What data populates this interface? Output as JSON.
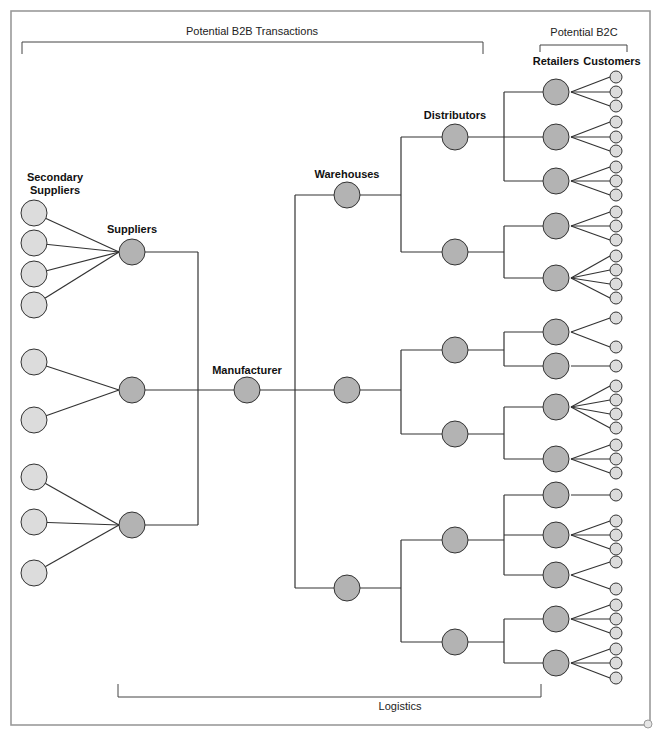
{
  "title_brackets": {
    "b2b": "Potential B2B Transactions",
    "b2c": "Potential B2C",
    "logistics": "Logistics"
  },
  "column_labels": {
    "secondary_suppliers_line1": "Secondary",
    "secondary_suppliers_line2": "Suppliers",
    "suppliers": "Suppliers",
    "manufacturer": "Manufacturer",
    "warehouses": "Warehouses",
    "distributors": "Distributors",
    "retailers": "Retailers",
    "customers": "Customers"
  },
  "colors": {
    "dark_node": "#b3b3b3",
    "light_node": "#dcdcdc",
    "stroke": "#333333",
    "frame": "#9a9a9a"
  },
  "structure": {
    "secondary_suppliers_per_supplier": [
      4,
      2,
      3
    ],
    "suppliers": 3,
    "manufacturer": 1,
    "warehouses": 3,
    "distributors_per_warehouse": [
      2,
      2,
      2
    ],
    "retailers_per_distributor": [
      3,
      2,
      2,
      2,
      3,
      2
    ],
    "customers_per_retailer": [
      3,
      3,
      3,
      3,
      4,
      2,
      1,
      4,
      3,
      1,
      3,
      2,
      3,
      3
    ]
  },
  "nodes": {
    "secondary_suppliers": [
      {
        "x": 34,
        "y": 213,
        "to": 0
      },
      {
        "x": 34,
        "y": 243,
        "to": 0
      },
      {
        "x": 34,
        "y": 274,
        "to": 0
      },
      {
        "x": 34,
        "y": 305,
        "to": 0
      },
      {
        "x": 34,
        "y": 362,
        "to": 1
      },
      {
        "x": 34,
        "y": 420,
        "to": 1
      },
      {
        "x": 34,
        "y": 477,
        "to": 2
      },
      {
        "x": 34,
        "y": 522,
        "to": 2
      },
      {
        "x": 34,
        "y": 573,
        "to": 2
      }
    ],
    "suppliers": [
      {
        "x": 132,
        "y": 252
      },
      {
        "x": 132,
        "y": 390
      },
      {
        "x": 132,
        "y": 525
      }
    ],
    "manufacturer": {
      "x": 247,
      "y": 390
    },
    "warehouses": [
      {
        "x": 347,
        "y": 195
      },
      {
        "x": 347,
        "y": 390
      },
      {
        "x": 347,
        "y": 588
      }
    ],
    "distributors": [
      {
        "x": 455,
        "y": 137,
        "wh": 0
      },
      {
        "x": 455,
        "y": 252,
        "wh": 0
      },
      {
        "x": 455,
        "y": 350,
        "wh": 1
      },
      {
        "x": 455,
        "y": 434,
        "wh": 1
      },
      {
        "x": 455,
        "y": 540,
        "wh": 2
      },
      {
        "x": 455,
        "y": 642,
        "wh": 2
      }
    ],
    "retailers": [
      {
        "x": 556,
        "y": 92,
        "d": 0,
        "c": [
          77,
          92,
          106
        ]
      },
      {
        "x": 556,
        "y": 137,
        "d": 0,
        "c": [
          122,
          137,
          151
        ]
      },
      {
        "x": 556,
        "y": 181,
        "d": 0,
        "c": [
          167,
          181,
          195
        ]
      },
      {
        "x": 556,
        "y": 226,
        "d": 1,
        "c": [
          212,
          226,
          240
        ]
      },
      {
        "x": 556,
        "y": 278,
        "d": 1,
        "c": [
          256,
          270,
          284,
          298
        ]
      },
      {
        "x": 556,
        "y": 332,
        "d": 2,
        "c": [
          318,
          347
        ]
      },
      {
        "x": 556,
        "y": 366,
        "d": 2,
        "c": [
          366
        ]
      },
      {
        "x": 556,
        "y": 407,
        "d": 3,
        "c": [
          386,
          400,
          414,
          428
        ]
      },
      {
        "x": 556,
        "y": 459,
        "d": 3,
        "c": [
          445,
          459,
          473
        ]
      },
      {
        "x": 556,
        "y": 495,
        "d": 4,
        "c": [
          495
        ]
      },
      {
        "x": 556,
        "y": 535,
        "d": 4,
        "c": [
          521,
          535,
          549
        ]
      },
      {
        "x": 556,
        "y": 575,
        "d": 4,
        "c": [
          562,
          589
        ]
      },
      {
        "x": 556,
        "y": 619,
        "d": 5,
        "c": [
          605,
          619,
          633
        ]
      },
      {
        "x": 556,
        "y": 663,
        "d": 5,
        "c": [
          649,
          663,
          678
        ]
      }
    ],
    "customer_x": 616
  }
}
